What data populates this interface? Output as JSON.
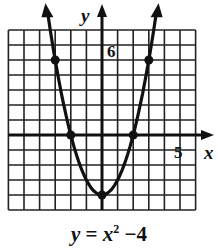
{
  "chart_data": {
    "type": "line",
    "title": "",
    "equation": "y = x^2 - 4",
    "caption": {
      "lhs": "y",
      "eq": " = ",
      "base": "x",
      "exp": "2",
      "rest": " −4"
    },
    "xlabel": "x",
    "ylabel": "y",
    "xlim": [
      -6,
      6
    ],
    "ylim": [
      -5,
      7
    ],
    "grid": true,
    "tick_labels": {
      "x": [
        "5"
      ],
      "y": [
        "6"
      ]
    },
    "series": [
      {
        "name": "y = x^2 - 4",
        "x": [
          -3,
          -2,
          -1,
          0,
          1,
          2,
          3
        ],
        "y": [
          5,
          0,
          -3,
          -4,
          -3,
          0,
          5
        ]
      }
    ],
    "marked_points": [
      [
        -3,
        5
      ],
      [
        -2,
        0
      ],
      [
        0,
        -4
      ],
      [
        2,
        0
      ],
      [
        3,
        5
      ]
    ],
    "color": "#111111"
  }
}
